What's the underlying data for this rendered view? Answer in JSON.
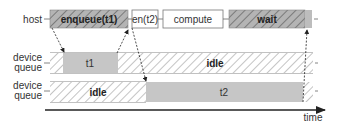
{
  "rows": {
    "host": {
      "label": "host"
    },
    "device_queue_1": {
      "label_line1": "device",
      "label_line2": "queue"
    },
    "device_queue_2": {
      "label_line1": "device",
      "label_line2": "queue"
    }
  },
  "host_blocks": {
    "enqueue_t1": "enqueue(t1)",
    "enqueue_t2": "en(t2)",
    "compute": "compute",
    "wait": "wait"
  },
  "queue1_blocks": {
    "t1": "t1",
    "idle": "idle"
  },
  "queue2_blocks": {
    "idle": "idle",
    "t2": "t2"
  },
  "axis": {
    "label": "time"
  },
  "colors": {
    "hatch_fill": "#a8a8a8",
    "task_fill": "#c6c6c6",
    "outline": "#555555",
    "text": "#333333"
  }
}
